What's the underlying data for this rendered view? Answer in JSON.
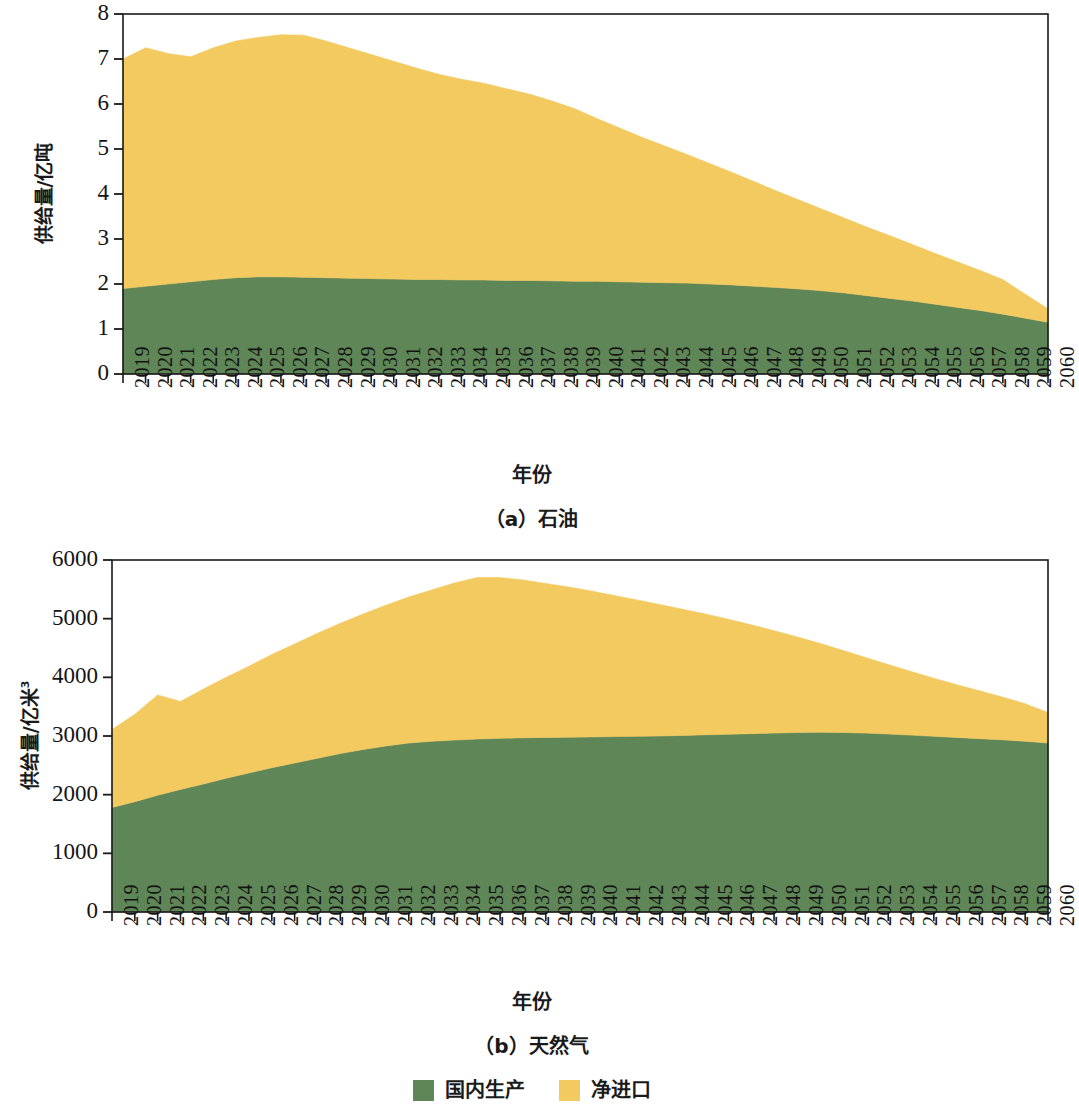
{
  "figure": {
    "panels": [
      {
        "id": "oil",
        "caption": "（a）石油",
        "ylabel_main": "供给量/亿吨",
        "ylabel_sup": "",
        "xlabel": "年份"
      },
      {
        "id": "gas",
        "caption": "（b）天然气",
        "ylabel_main": "供给量/亿米",
        "ylabel_sup": "3",
        "xlabel": "年份"
      }
    ]
  },
  "legend": {
    "position": "bottom-center",
    "entries": [
      {
        "label": "国内生产",
        "color": "#5f8657"
      },
      {
        "label": "净进口",
        "color": "#f3ca5f"
      }
    ]
  },
  "colors": {
    "domestic_green": "#5f8657",
    "net_import_yellow": "#f3ca5f",
    "axis": "#1a1a1a",
    "background": "#ffffff"
  },
  "chart_data": [
    {
      "type": "area",
      "stacked": true,
      "id": "oil",
      "title": "（a）石油",
      "xlabel": "年份",
      "ylabel": "供给量/亿吨",
      "ylim": [
        0,
        8
      ],
      "yticks": [
        0,
        1,
        2,
        3,
        4,
        5,
        6,
        7,
        8
      ],
      "ytick_labels": [
        "0",
        "1",
        "2",
        "3",
        "4",
        "5",
        "6",
        "7",
        "8"
      ],
      "xlim": [
        2019,
        2060
      ],
      "grid": false,
      "categories": [
        2019,
        2020,
        2021,
        2022,
        2023,
        2024,
        2025,
        2026,
        2027,
        2028,
        2029,
        2030,
        2031,
        2032,
        2033,
        2034,
        2035,
        2036,
        2037,
        2038,
        2039,
        2040,
        2041,
        2042,
        2043,
        2044,
        2045,
        2046,
        2047,
        2048,
        2049,
        2050,
        2051,
        2052,
        2053,
        2054,
        2055,
        2056,
        2057,
        2058,
        2059,
        2060
      ],
      "series": [
        {
          "name": "国内生产",
          "color": "#5f8657",
          "values": [
            1.9,
            1.95,
            2.0,
            2.05,
            2.1,
            2.14,
            2.16,
            2.16,
            2.15,
            2.14,
            2.13,
            2.12,
            2.11,
            2.1,
            2.1,
            2.09,
            2.09,
            2.08,
            2.08,
            2.07,
            2.06,
            2.06,
            2.05,
            2.04,
            2.03,
            2.02,
            2.0,
            1.98,
            1.95,
            1.92,
            1.89,
            1.85,
            1.8,
            1.74,
            1.68,
            1.62,
            1.55,
            1.48,
            1.41,
            1.33,
            1.24,
            1.15
          ]
        },
        {
          "name": "净进口",
          "color": "#f3ca5f",
          "values": [
            5.1,
            5.3,
            5.12,
            5.0,
            5.15,
            5.26,
            5.32,
            5.38,
            5.38,
            5.26,
            5.12,
            4.98,
            4.84,
            4.7,
            4.56,
            4.46,
            4.37,
            4.26,
            4.14,
            4.0,
            3.84,
            3.62,
            3.42,
            3.22,
            3.04,
            2.86,
            2.68,
            2.5,
            2.32,
            2.14,
            1.97,
            1.81,
            1.66,
            1.52,
            1.39,
            1.26,
            1.13,
            1.01,
            0.89,
            0.77,
            0.53,
            0.3
          ]
        }
      ],
      "totals": [
        7.0,
        7.25,
        7.12,
        7.05,
        7.25,
        7.4,
        7.48,
        7.54,
        7.53,
        7.4,
        7.25,
        7.1,
        6.95,
        6.8,
        6.66,
        6.55,
        6.46,
        6.34,
        6.22,
        6.07,
        5.9,
        5.68,
        5.47,
        5.26,
        5.07,
        4.88,
        4.68,
        4.48,
        4.27,
        4.06,
        3.86,
        3.66,
        3.46,
        3.26,
        3.07,
        2.88,
        2.68,
        2.49,
        2.3,
        2.1,
        1.77,
        1.45
      ]
    },
    {
      "type": "area",
      "stacked": true,
      "id": "gas",
      "title": "（b）天然气",
      "xlabel": "年份",
      "ylabel": "供给量/亿米3",
      "ylim": [
        0,
        6000
      ],
      "yticks": [
        0,
        1000,
        2000,
        3000,
        4000,
        5000,
        6000
      ],
      "ytick_labels": [
        "0",
        "1000",
        "2000",
        "3000",
        "4000",
        "5000",
        "6000"
      ],
      "xlim": [
        2019,
        2060
      ],
      "grid": false,
      "categories": [
        2019,
        2020,
        2021,
        2022,
        2023,
        2024,
        2025,
        2026,
        2027,
        2028,
        2029,
        2030,
        2031,
        2032,
        2033,
        2034,
        2035,
        2036,
        2037,
        2038,
        2039,
        2040,
        2041,
        2042,
        2043,
        2044,
        2045,
        2046,
        2047,
        2048,
        2049,
        2050,
        2051,
        2052,
        2053,
        2054,
        2055,
        2056,
        2057,
        2058,
        2059,
        2060
      ],
      "series": [
        {
          "name": "国内生产",
          "color": "#5f8657",
          "values": [
            1780,
            1880,
            1990,
            2090,
            2180,
            2280,
            2370,
            2460,
            2540,
            2620,
            2700,
            2770,
            2830,
            2880,
            2910,
            2930,
            2950,
            2960,
            2970,
            2975,
            2980,
            2985,
            2990,
            2995,
            3000,
            3010,
            3020,
            3030,
            3040,
            3050,
            3060,
            3065,
            3060,
            3050,
            3035,
            3015,
            2995,
            2975,
            2955,
            2935,
            2910,
            2880
          ]
        },
        {
          "name": "净进口",
          "color": "#f3ca5f",
          "values": [
            1330,
            1490,
            1710,
            1500,
            1620,
            1720,
            1820,
            1930,
            2030,
            2130,
            2220,
            2310,
            2400,
            2490,
            2580,
            2680,
            2750,
            2740,
            2690,
            2625,
            2560,
            2485,
            2405,
            2325,
            2240,
            2150,
            2060,
            1960,
            1855,
            1745,
            1630,
            1515,
            1400,
            1290,
            1185,
            1085,
            990,
            900,
            815,
            730,
            640,
            520
          ]
        }
      ],
      "totals": [
        3110,
        3370,
        3700,
        3590,
        3800,
        4000,
        4190,
        4390,
        4570,
        4750,
        4920,
        5080,
        5230,
        5370,
        5490,
        5610,
        5700,
        5700,
        5660,
        5600,
        5540,
        5470,
        5395,
        5320,
        5240,
        5160,
        5080,
        4990,
        4895,
        4795,
        4690,
        4580,
        4460,
        4340,
        4220,
        4100,
        3985,
        3875,
        3770,
        3665,
        3550,
        3400
      ]
    }
  ]
}
